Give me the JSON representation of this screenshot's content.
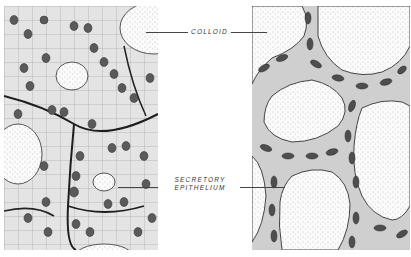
{
  "figure": {
    "panels": [
      {
        "id": "left",
        "description": "Active thyroid follicles with tall columnar secretory epithelium and small colloid lumens"
      },
      {
        "id": "right",
        "description": "Inactive thyroid follicles with flattened epithelium and large colloid-filled lumens"
      }
    ],
    "labels": {
      "colloid": "COLLOID",
      "epithelium_line1": "SECRETORY",
      "epithelium_line2": "EPITHELIUM"
    },
    "colors": {
      "background": "#ffffff",
      "ink": "#2a2a2a",
      "colloid_stipple": "#9a9a9a",
      "cell_fill": "#e6e6e6",
      "nucleus": "#555555"
    }
  }
}
